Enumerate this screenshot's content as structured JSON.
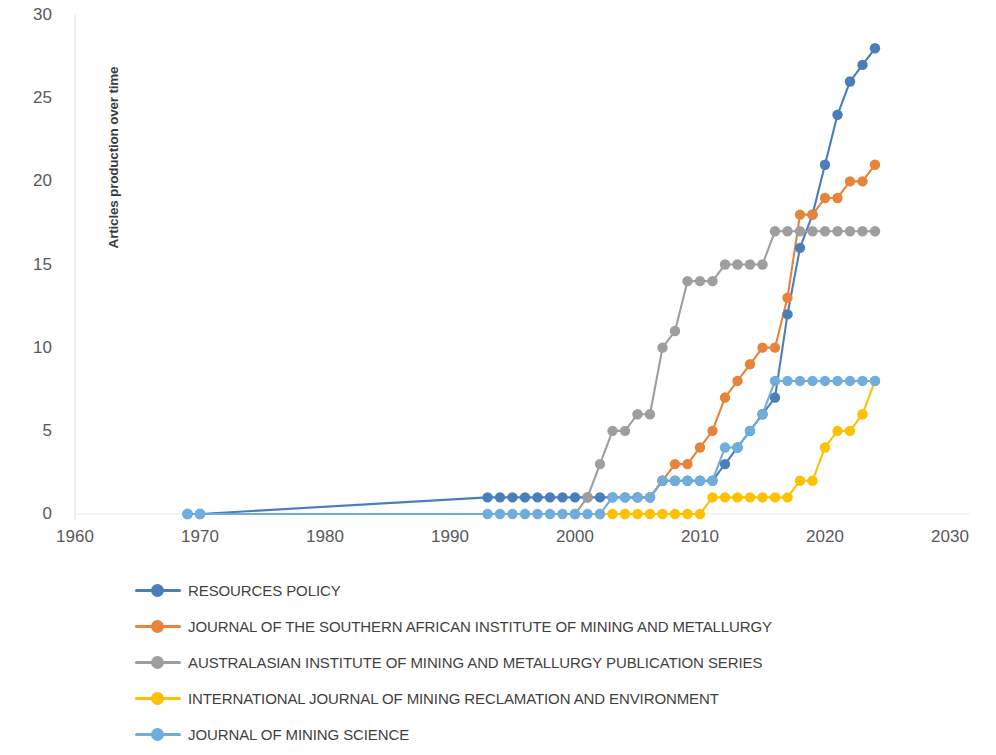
{
  "chart_data": {
    "type": "line",
    "title": "",
    "xlabel": "",
    "ylabel": "Articles production over time",
    "xlim": [
      1960,
      2030
    ],
    "ylim": [
      0,
      30
    ],
    "xticks": [
      1960,
      1970,
      1980,
      1990,
      2000,
      2010,
      2020,
      2030
    ],
    "yticks": [
      0,
      5,
      10,
      15,
      20,
      25,
      30
    ],
    "grid": false,
    "legend_position": "bottom-left",
    "markers": "circle",
    "series": [
      {
        "name": "RESOURCES POLICY",
        "color": "#4A7EBB",
        "x": [
          1969,
          1970,
          1993,
          1994,
          1995,
          1996,
          1997,
          1998,
          1999,
          2000,
          2001,
          2002,
          2003,
          2004,
          2005,
          2006,
          2007,
          2008,
          2009,
          2010,
          2011,
          2012,
          2013,
          2014,
          2015,
          2016,
          2017,
          2018,
          2019,
          2020,
          2021,
          2022,
          2023,
          2024
        ],
        "y": [
          0,
          0,
          1,
          1,
          1,
          1,
          1,
          1,
          1,
          1,
          1,
          1,
          1,
          1,
          1,
          1,
          2,
          2,
          2,
          2,
          2,
          3,
          4,
          5,
          6,
          7,
          12,
          16,
          18,
          21,
          24,
          26,
          27,
          28
        ]
      },
      {
        "name": "JOURNAL OF THE SOUTHERN AFRICAN INSTITUTE OF MINING AND METALLURGY",
        "color": "#E8833A",
        "x": [
          2005,
          2006,
          2007,
          2008,
          2009,
          2010,
          2011,
          2012,
          2013,
          2014,
          2015,
          2016,
          2017,
          2018,
          2019,
          2020,
          2021,
          2022,
          2023,
          2024
        ],
        "y": [
          1,
          1,
          2,
          3,
          3,
          4,
          5,
          7,
          8,
          9,
          10,
          10,
          13,
          18,
          18,
          19,
          19,
          20,
          20,
          21
        ]
      },
      {
        "name": "AUSTRALASIAN INSTITUTE OF MINING AND METALLURGY PUBLICATION SERIES",
        "color": "#9E9E9E",
        "x": [
          2000,
          2001,
          2002,
          2003,
          2004,
          2005,
          2006,
          2007,
          2008,
          2009,
          2010,
          2011,
          2012,
          2013,
          2014,
          2015,
          2016,
          2017,
          2018,
          2019,
          2020,
          2021,
          2022,
          2023,
          2024
        ],
        "y": [
          0,
          1,
          3,
          5,
          5,
          6,
          6,
          10,
          11,
          14,
          14,
          14,
          15,
          15,
          15,
          15,
          17,
          17,
          17,
          17,
          17,
          17,
          17,
          17,
          17
        ]
      },
      {
        "name": "INTERNATIONAL JOURNAL OF MINING RECLAMATION AND ENVIRONMENT",
        "color": "#FFC000",
        "x": [
          2002,
          2003,
          2004,
          2005,
          2006,
          2007,
          2008,
          2009,
          2010,
          2011,
          2012,
          2013,
          2014,
          2015,
          2016,
          2017,
          2018,
          2019,
          2020,
          2021,
          2022,
          2023,
          2024
        ],
        "y": [
          0,
          0,
          0,
          0,
          0,
          0,
          0,
          0,
          0,
          1,
          1,
          1,
          1,
          1,
          1,
          1,
          2,
          2,
          4,
          5,
          5,
          6,
          8
        ]
      },
      {
        "name": "JOURNAL OF MINING SCIENCE",
        "color": "#6FAEDC",
        "x": [
          1969,
          1970,
          1993,
          1994,
          1995,
          1996,
          1997,
          1998,
          1999,
          2000,
          2001,
          2002,
          2003,
          2004,
          2005,
          2006,
          2007,
          2008,
          2009,
          2010,
          2011,
          2012,
          2013,
          2014,
          2015,
          2016,
          2017,
          2018,
          2019,
          2020,
          2021,
          2022,
          2023,
          2024
        ],
        "y": [
          0,
          0,
          0,
          0,
          0,
          0,
          0,
          0,
          0,
          0,
          0,
          0,
          1,
          1,
          1,
          1,
          2,
          2,
          2,
          2,
          2,
          4,
          4,
          5,
          6,
          8,
          8,
          8,
          8,
          8,
          8,
          8,
          8,
          8
        ]
      }
    ]
  },
  "axis": {
    "y_title": "Articles production over time",
    "y_tick_labels": [
      "30",
      "25",
      "20",
      "15",
      "10",
      "5",
      "0"
    ],
    "x_tick_labels": [
      "1960",
      "1970",
      "1980",
      "1990",
      "2000",
      "2010",
      "2020",
      "2030"
    ]
  },
  "legend": {
    "items": [
      {
        "label": "RESOURCES POLICY",
        "color": "#4A7EBB"
      },
      {
        "label": "JOURNAL OF THE SOUTHERN AFRICAN INSTITUTE OF MINING AND METALLURGY",
        "color": "#E8833A"
      },
      {
        "label": "AUSTRALASIAN INSTITUTE OF MINING AND METALLURGY PUBLICATION SERIES",
        "color": "#9E9E9E"
      },
      {
        "label": "INTERNATIONAL JOURNAL OF MINING RECLAMATION AND ENVIRONMENT",
        "color": "#FFC000"
      },
      {
        "label": "JOURNAL OF MINING SCIENCE",
        "color": "#6FAEDC"
      }
    ]
  }
}
